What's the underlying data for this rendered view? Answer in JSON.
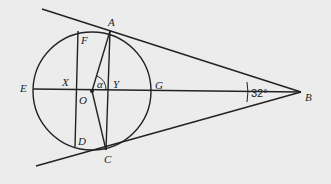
{
  "diagram": {
    "labels": {
      "A": "A",
      "B": "B",
      "C": "C",
      "D": "D",
      "E": "E",
      "F": "F",
      "G": "G",
      "O": "O",
      "X": "X",
      "Y": "Y",
      "alpha": "α"
    },
    "angle_at_B": "32°",
    "colors": {
      "background": "#ececec",
      "stroke": "#222222"
    }
  }
}
